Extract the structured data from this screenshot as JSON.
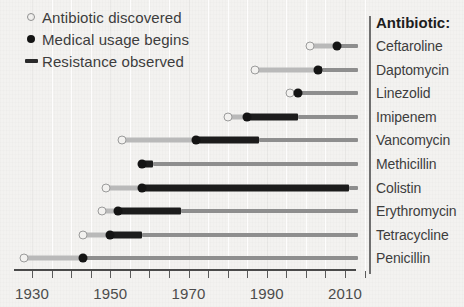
{
  "chart_data": {
    "type": "timeline",
    "title": "",
    "xlabel": "Year",
    "ylabel": "Antibiotic:",
    "xlim": [
      1926,
      2017
    ],
    "xticks": [
      1930,
      1935,
      1940,
      1945,
      1950,
      1955,
      1960,
      1965,
      1970,
      1975,
      1980,
      1985,
      1990,
      1995,
      2000,
      2005,
      2010,
      2015
    ],
    "xtick_labels": [
      {
        "value": 1930,
        "label": "1930"
      },
      {
        "value": 1950,
        "label": "1950"
      },
      {
        "value": 1970,
        "label": "1970"
      },
      {
        "value": 1990,
        "label": "1990"
      },
      {
        "value": 2010,
        "label": "2010"
      }
    ],
    "legend": {
      "position": "top-left",
      "entries": [
        {
          "icon": "open-circle",
          "label": "Antibiotic discovered"
        },
        {
          "icon": "filled-circle",
          "label": "Medical usage begins"
        },
        {
          "icon": "thick-bar",
          "label": "Resistance observed"
        }
      ]
    },
    "series_colors": {
      "discovered_segment": "#b9b9b9",
      "usage_segment": "#8e8e8e",
      "resistance_segment": "#1c1c1c",
      "axis": "#4a4a4a",
      "background": "#f3f2f0"
    },
    "rows": [
      {
        "name": "Ceftaroline",
        "discovered": 2001,
        "usage_begins": 2008,
        "resistance": null
      },
      {
        "name": "Daptomycin",
        "discovered": 1987,
        "usage_begins": 2003,
        "resistance": 2004
      },
      {
        "name": "Linezolid",
        "discovered": 1996,
        "usage_begins": 1998,
        "resistance": null
      },
      {
        "name": "Imipenem",
        "discovered": 1980,
        "usage_begins": 1985,
        "resistance": 1998
      },
      {
        "name": "Vancomycin",
        "discovered": 1953,
        "usage_begins": 1972,
        "resistance": 1988
      },
      {
        "name": "Methicillin",
        "discovered": null,
        "usage_begins": 1958,
        "resistance": 1961
      },
      {
        "name": "Colistin",
        "discovered": 1949,
        "usage_begins": 1958,
        "resistance": 2011
      },
      {
        "name": "Erythromycin",
        "discovered": 1948,
        "usage_begins": 1952,
        "resistance": 1968
      },
      {
        "name": "Tetracycline",
        "discovered": 1943,
        "usage_begins": 1950,
        "resistance": 1958
      },
      {
        "name": "Penicillin",
        "discovered": 1928,
        "usage_begins": 1943,
        "resistance": null
      }
    ]
  },
  "axis": {
    "xlabel": "Year",
    "panel_header": "Antibiotic:"
  }
}
